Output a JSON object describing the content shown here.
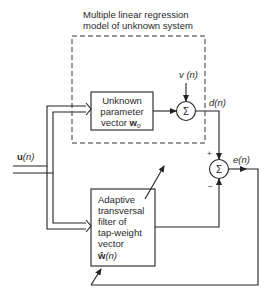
{
  "title": {
    "line1": "Multiple linear regression",
    "line2": "model of unknown system"
  },
  "blocks": {
    "unknown": {
      "line1": "Unknown",
      "line2": "parameter",
      "line3": "vector ",
      "vector": "w",
      "subscript": "o"
    },
    "adaptive": {
      "line1": "Adaptive",
      "line2": "transversal",
      "line3": "filter of",
      "line4": "tap-weight",
      "line5": "vector",
      "vector": "ŵ",
      "arg": "(n)"
    }
  },
  "summers": {
    "symbol": "Σ",
    "plus": "+",
    "minus": "−"
  },
  "signals": {
    "input": "u",
    "input_arg": "(n)",
    "noise": "v (n)",
    "desired": "d(n)",
    "error": "e(n)"
  },
  "colors": {
    "line": "#222222",
    "text": "#2a2a2a",
    "background": "#ffffff"
  }
}
